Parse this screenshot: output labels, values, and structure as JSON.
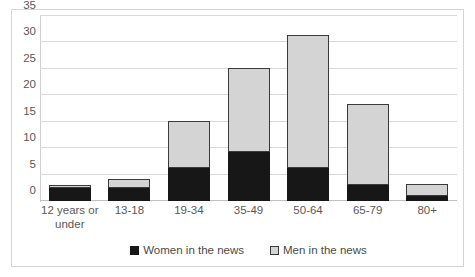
{
  "chart_data": {
    "type": "bar",
    "stacked": true,
    "title": "",
    "subtitle": "",
    "xlabel": "",
    "ylabel": "",
    "categories": [
      "12 years or under",
      "13-18",
      "19-34",
      "35-49",
      "50-64",
      "65-79",
      "80+"
    ],
    "series": [
      {
        "name": "Women in the news",
        "color": "#171717",
        "values": [
          2.5,
          2.5,
          6.2,
          9.2,
          6.2,
          3.0,
          1.0
        ]
      },
      {
        "name": "Men in the news",
        "color": "#d4d4d4",
        "values": [
          0.5,
          1.7,
          9.0,
          16.0,
          25.3,
          15.4,
          2.3
        ]
      }
    ],
    "totals": [
      3.0,
      4.2,
      15.2,
      25.2,
      31.5,
      18.4,
      3.3
    ],
    "ylim": [
      0,
      35
    ],
    "yticks": [
      "0",
      "5",
      "10",
      "15",
      "20",
      "25",
      "30",
      "35"
    ],
    "ytick_values": [
      0,
      5,
      10,
      15,
      20,
      25,
      30,
      35
    ],
    "grid": true,
    "legend_position": "bottom",
    "legend_entries": [
      "Women in the news",
      "Men in the news"
    ]
  },
  "colors": {
    "women": "#171717",
    "men": "#d4d4d4",
    "bar_outline": "#3a3a3a",
    "gridline": "#d9d9d9",
    "frame": "#d4d4d4",
    "tick_text": "#595959",
    "background": "#ffffff"
  }
}
